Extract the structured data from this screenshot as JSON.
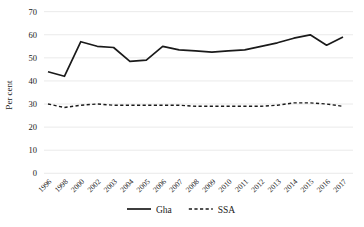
{
  "chart_data": {
    "type": "line",
    "title": "",
    "xlabel": "",
    "ylabel": "Per cent",
    "ylim": [
      0,
      70
    ],
    "ytick_step": 10,
    "grid": true,
    "legend_position": "bottom-center",
    "categories": [
      "1996",
      "1998",
      "2000",
      "2002",
      "2003",
      "2004",
      "2005",
      "2006",
      "2007",
      "2008",
      "2009",
      "2010",
      "2011",
      "2012",
      "2013",
      "2014",
      "2015",
      "2016",
      "2017"
    ],
    "series": [
      {
        "name": "Gha",
        "style": "solid",
        "values": [
          44,
          42,
          57,
          55,
          54.5,
          48.5,
          49,
          55,
          53.5,
          53,
          52.5,
          53,
          53.5,
          55,
          56.5,
          58.5,
          60,
          55.5,
          59
        ]
      },
      {
        "name": "SSA",
        "style": "dashed",
        "values": [
          30,
          28.5,
          29.5,
          30,
          29.5,
          29.5,
          29.5,
          29.5,
          29.5,
          29,
          29,
          29,
          29,
          29,
          29.5,
          30.5,
          30.5,
          30,
          29
        ]
      }
    ]
  },
  "colors": {
    "line": "#1a1a1a",
    "grid": "#e4e4e4",
    "text": "#1a1a1a",
    "background": "#ffffff"
  }
}
